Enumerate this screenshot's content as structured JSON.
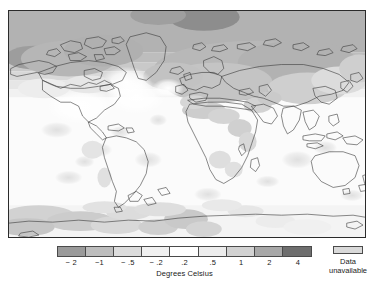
{
  "figure": {
    "kind": "choropleth-world-map",
    "frame_border_color": "#2b2b2b"
  },
  "legend": {
    "axis_title": "Degrees Celsius",
    "tick_labels": [
      "− 2",
      "−1",
      "− .5",
      "− .2",
      ".2",
      ".5",
      "1",
      "2",
      "4"
    ],
    "tick_values": [
      -2,
      -1,
      -0.5,
      -0.2,
      0.2,
      0.5,
      1,
      2,
      4
    ],
    "swatch_colors": [
      "#9a9a9a",
      "#bdbdbd",
      "#dcdcdc",
      "#f0f0f0",
      "#ffffff",
      "#ececec",
      "#d2d2d2",
      "#a8a8a8",
      "#6e6e6e"
    ],
    "unavailable": {
      "line1": "Data",
      "line2": "unavailable",
      "color": "#d9d9d9"
    }
  },
  "chart_data": {
    "type": "heatmap",
    "title": "",
    "xlabel": "",
    "ylabel": "",
    "colorbar_label": "Degrees Celsius",
    "colorbar_categories": [
      "< −2",
      "−2 to −1",
      "−1 to −.5",
      "−.5 to −.2",
      "−.2 to .2",
      ".2 to .5",
      ".5 to 1",
      "1 to 2",
      "2 to 4"
    ],
    "colorbar_tick_values": [
      -2,
      -1,
      -0.5,
      -0.2,
      0.2,
      0.5,
      1,
      2,
      4
    ],
    "colorbar_colors": [
      "#9a9a9a",
      "#bdbdbd",
      "#dcdcdc",
      "#f0f0f0",
      "#ffffff",
      "#ececec",
      "#d2d2d2",
      "#a8a8a8",
      "#6e6e6e"
    ],
    "missing_data_color": "#d9d9d9",
    "missing_data_label": "Data unavailable",
    "projection": "equirectangular",
    "lon_range": [
      -180,
      180
    ],
    "lat_range": [
      -90,
      90
    ],
    "grid": false,
    "legend_position": "bottom",
    "regions": [
      {
        "name": "Arctic Ocean / high Arctic",
        "value": 2.5,
        "color": "#a8a8a8"
      },
      {
        "name": "Barents / Kara Sea",
        "value": 3.2,
        "color": "#8f8f8f"
      },
      {
        "name": "Alaska / Bering Sea",
        "value": 1.6,
        "color": "#a8a8a8"
      },
      {
        "name": "Siberia",
        "value": 1.4,
        "color": "#b4b4b4"
      },
      {
        "name": "Northern Canada",
        "value": 1.3,
        "color": "#b4b4b4"
      },
      {
        "name": "Greenland",
        "value": 1.2,
        "color": "#bcbcbc"
      },
      {
        "name": "Northern Europe",
        "value": 1.1,
        "color": "#bcbcbc"
      },
      {
        "name": "Central Asia",
        "value": 0.9,
        "color": "#c8c8c8"
      },
      {
        "name": "Contiguous United States",
        "value": 0.4,
        "color": "#ededed"
      },
      {
        "name": "Sahara / Sahel",
        "value": 0.8,
        "color": "#cfcfcf"
      },
      {
        "name": "East Africa",
        "value": 0.7,
        "color": "#d6d6d6"
      },
      {
        "name": "South America",
        "value": 0.3,
        "color": "#f0f0f0"
      },
      {
        "name": "Australia",
        "value": 0.3,
        "color": "#f0f0f0"
      },
      {
        "name": "Tropical Pacific",
        "value": 0.15,
        "color": "#fafafa"
      },
      {
        "name": "North Atlantic",
        "value": 0.2,
        "color": "#f4f4f4"
      },
      {
        "name": "Southern Ocean",
        "value": 0.4,
        "color": "#e4e4e4"
      },
      {
        "name": "Antarctic Peninsula / West Antarctica",
        "value": 0.8,
        "color": "#cdcdcd"
      },
      {
        "name": "Antarctic interior (no data)",
        "value": null,
        "color": "#d9d9d9"
      }
    ]
  }
}
